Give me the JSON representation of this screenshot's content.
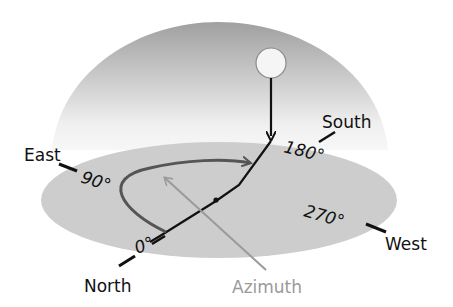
{
  "diagram": {
    "colors": {
      "background": "#ffffff",
      "dome_top": "#a3a3a3",
      "dome_bottom": "#f4f4f4",
      "ground": "#cdcdcd",
      "sun_fill": "#f5f5f5",
      "sun_stroke": "#8a8a8a",
      "line": "#111111",
      "arc": "#555555",
      "azimuth_pointer": "#9a9a9a"
    },
    "directions": {
      "north": "North",
      "east": "East",
      "south": "South",
      "west": "West"
    },
    "degrees": {
      "north": "0°",
      "east": "90°",
      "south": "180°",
      "west": "270°"
    },
    "annotation": {
      "azimuth": "Azimuth"
    },
    "icons": {
      "sun": "sun-icon"
    }
  }
}
